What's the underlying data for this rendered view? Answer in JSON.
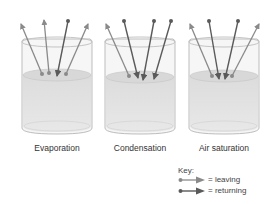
{
  "diagram": {
    "colors": {
      "leaving": "#8a8a8a",
      "returning": "#5a5a5a",
      "liquid": "#e2e2e2",
      "glass": "#bdbdbd"
    },
    "beakers": [
      {
        "label": "Evaporation",
        "leaving_count": 3,
        "returning_count": 1
      },
      {
        "label": "Condensation",
        "leaving_count": 1,
        "returning_count": 3
      },
      {
        "label": "Air saturation",
        "leaving_count": 2,
        "returning_count": 2
      }
    ],
    "key": {
      "title": "Key:",
      "items": [
        {
          "symbol": "leaving-arrow",
          "text": "= leaving"
        },
        {
          "symbol": "returning-arrow",
          "text": "= returning"
        }
      ]
    }
  }
}
